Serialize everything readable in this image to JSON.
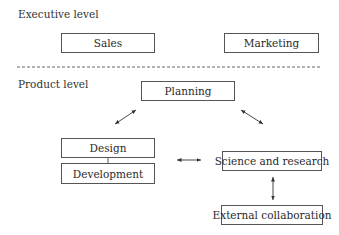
{
  "sections": {
    "executive": {
      "label": "Executive level"
    },
    "product": {
      "label": "Product level"
    }
  },
  "nodes": {
    "sales": "Sales",
    "marketing": "Marketing",
    "planning": "Planning",
    "design": "Design",
    "development": "Development",
    "science": "Science and research",
    "external": "External collaboration"
  },
  "edges": [
    {
      "from": "planning",
      "to": "design-development",
      "type": "bidirectional"
    },
    {
      "from": "planning",
      "to": "science",
      "type": "bidirectional"
    },
    {
      "from": "design-development",
      "to": "science",
      "type": "bidirectional"
    },
    {
      "from": "science",
      "to": "external",
      "type": "bidirectional"
    },
    {
      "from": "design",
      "to": "development",
      "type": "line"
    }
  ],
  "colors": {
    "stroke": "#555555",
    "text": "#2a2a2a"
  }
}
